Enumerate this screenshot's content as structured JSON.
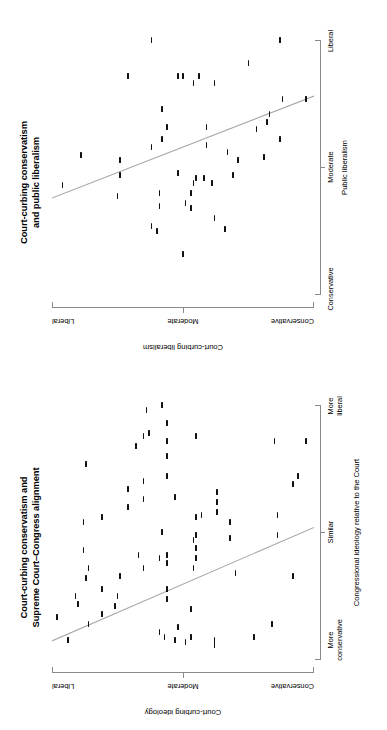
{
  "figure": {
    "orientation": "rotated-90-ccw",
    "background": "#ffffff",
    "point_color": "#111111",
    "fit_line_color": "#a8a8a8",
    "axis_color": "#8a8a8a"
  },
  "panels": [
    {
      "id": "congress",
      "title_line1": "Court-curbing conservatism and",
      "title_line2": "Supreme Court–Congress alignment",
      "x_axis_title": "Congressional ideology relative to the Court",
      "x_tick_labels": [
        "More\nconservative",
        "Similar",
        "More\nliberal"
      ],
      "x_tick_label_1": "More",
      "x_tick_label_1b": "conservative",
      "x_tick_label_2": "Similar",
      "x_tick_label_3": "More",
      "x_tick_label_3b": "liberal",
      "y_axis_title": "Court-curbing ideology",
      "y_tick_labels": [
        "Conservative",
        "Moderate",
        "Liberal"
      ]
    },
    {
      "id": "public",
      "title_line1": "Court-curbing conservatism",
      "title_line2": "and public liberalism",
      "x_axis_title": "Public liberalism",
      "x_tick_label_1": "Conservative",
      "x_tick_label_2": "Moderate",
      "x_tick_label_3": "Liberal",
      "y_axis_title": "Court-curbing liberalism",
      "y_tick_labels": [
        "Conservative",
        "Moderate",
        "Liberal"
      ]
    }
  ],
  "chart_data": [
    {
      "type": "scatter",
      "panel": "congress",
      "title": "Court-curbing conservatism and Supreme Court–Congress alignment",
      "xlabel": "Congressional ideology relative to the Court",
      "ylabel": "Court-curbing ideology",
      "xlim": [
        0,
        100
      ],
      "ylim": [
        0,
        100
      ],
      "grid": false,
      "legend": null,
      "xtick_values": [
        12,
        50,
        90
      ],
      "xtick_labels": [
        "More conservative",
        "Similar",
        "More liberal"
      ],
      "ytick_values": [
        8,
        50,
        92
      ],
      "ytick_labels": [
        "Conservative",
        "Moderate",
        "Liberal"
      ],
      "fit_line": {
        "x0": 7.5,
        "y0": 100,
        "x1": 52,
        "y1": 0
      },
      "points": [
        {
          "x": 8,
          "y": 94
        },
        {
          "x": 17,
          "y": 98
        },
        {
          "x": 22,
          "y": 90
        },
        {
          "x": 25,
          "y": 91
        },
        {
          "x": 14,
          "y": 86
        },
        {
          "x": 32,
          "y": 87
        },
        {
          "x": 36,
          "y": 86
        },
        {
          "x": 43,
          "y": 88
        },
        {
          "x": 54,
          "y": 88
        },
        {
          "x": 77,
          "y": 87
        },
        {
          "x": 18,
          "y": 81
        },
        {
          "x": 28,
          "y": 81
        },
        {
          "x": 56,
          "y": 81
        },
        {
          "x": 21,
          "y": 76
        },
        {
          "x": 25,
          "y": 75
        },
        {
          "x": 33,
          "y": 74
        },
        {
          "x": 60,
          "y": 71
        },
        {
          "x": 67,
          "y": 71
        },
        {
          "x": 84,
          "y": 68
        },
        {
          "x": 36,
          "y": 65
        },
        {
          "x": 41,
          "y": 67
        },
        {
          "x": 63,
          "y": 65
        },
        {
          "x": 70,
          "y": 65
        },
        {
          "x": 88,
          "y": 65
        },
        {
          "x": 89,
          "y": 63
        },
        {
          "x": 98,
          "y": 64
        },
        {
          "x": 11,
          "y": 59
        },
        {
          "x": 9,
          "y": 57
        },
        {
          "x": 40,
          "y": 59
        },
        {
          "x": 50,
          "y": 58
        },
        {
          "x": 24,
          "y": 56
        },
        {
          "x": 28,
          "y": 56
        },
        {
          "x": 38,
          "y": 56
        },
        {
          "x": 41,
          "y": 56
        },
        {
          "x": 72,
          "y": 56
        },
        {
          "x": 80,
          "y": 56
        },
        {
          "x": 86,
          "y": 56
        },
        {
          "x": 93,
          "y": 56
        },
        {
          "x": 100,
          "y": 58
        },
        {
          "x": 8,
          "y": 53
        },
        {
          "x": 13,
          "y": 52
        },
        {
          "x": 64,
          "y": 53
        },
        {
          "x": 7,
          "y": 49
        },
        {
          "x": 9,
          "y": 47
        },
        {
          "x": 20,
          "y": 47
        },
        {
          "x": 36,
          "y": 46
        },
        {
          "x": 40,
          "y": 45
        },
        {
          "x": 44,
          "y": 45
        },
        {
          "x": 47,
          "y": 46
        },
        {
          "x": 49,
          "y": 45
        },
        {
          "x": 56,
          "y": 45
        },
        {
          "x": 57,
          "y": 43
        },
        {
          "x": 88,
          "y": 45
        },
        {
          "x": 6,
          "y": 38
        },
        {
          "x": 8,
          "y": 38
        },
        {
          "x": 58,
          "y": 37
        },
        {
          "x": 62,
          "y": 37
        },
        {
          "x": 66,
          "y": 37
        },
        {
          "x": 48,
          "y": 32
        },
        {
          "x": 54,
          "y": 32
        },
        {
          "x": 34,
          "y": 30
        },
        {
          "x": 9,
          "y": 23
        },
        {
          "x": 14,
          "y": 16
        },
        {
          "x": 49,
          "y": 14
        },
        {
          "x": 57,
          "y": 14
        },
        {
          "x": 86,
          "y": 15
        },
        {
          "x": 33,
          "y": 8
        },
        {
          "x": 69,
          "y": 8
        },
        {
          "x": 72,
          "y": 6
        },
        {
          "x": 86,
          "y": 3
        }
      ]
    },
    {
      "type": "scatter",
      "panel": "public",
      "title": "Court-curbing conservatism and public liberalism",
      "xlabel": "Public liberalism",
      "ylabel": "Court-curbing liberalism",
      "xlim": [
        0,
        100
      ],
      "ylim": [
        0,
        100
      ],
      "grid": false,
      "legend": null,
      "xtick_values": [
        10,
        50,
        90
      ],
      "xtick_labels": [
        "Conservative",
        "Moderate",
        "Liberal"
      ],
      "ytick_values": [
        8,
        50,
        92
      ],
      "ytick_labels": [
        "Conservative",
        "Moderate",
        "Liberal"
      ],
      "fit_line": {
        "x0": 38,
        "y0": 100,
        "x1": 78,
        "y1": 0
      },
      "points": [
        {
          "x": 43,
          "y": 96
        },
        {
          "x": 55,
          "y": 89
        },
        {
          "x": 39,
          "y": 75
        },
        {
          "x": 47,
          "y": 74
        },
        {
          "x": 53,
          "y": 74
        },
        {
          "x": 86,
          "y": 71
        },
        {
          "x": 27,
          "y": 62
        },
        {
          "x": 25,
          "y": 60
        },
        {
          "x": 58,
          "y": 62
        },
        {
          "x": 35,
          "y": 59
        },
        {
          "x": 40,
          "y": 59
        },
        {
          "x": 61,
          "y": 58
        },
        {
          "x": 73,
          "y": 58
        },
        {
          "x": 66,
          "y": 56
        },
        {
          "x": 100,
          "y": 62
        },
        {
          "x": 48,
          "y": 52
        },
        {
          "x": 16,
          "y": 50
        },
        {
          "x": 36,
          "y": 49
        },
        {
          "x": 86,
          "y": 52
        },
        {
          "x": 86,
          "y": 50
        },
        {
          "x": 34,
          "y": 47
        },
        {
          "x": 40,
          "y": 47
        },
        {
          "x": 44,
          "y": 46
        },
        {
          "x": 46,
          "y": 45
        },
        {
          "x": 83,
          "y": 46
        },
        {
          "x": 86,
          "y": 44
        },
        {
          "x": 46,
          "y": 42
        },
        {
          "x": 59,
          "y": 41
        },
        {
          "x": 66,
          "y": 41
        },
        {
          "x": 30,
          "y": 38
        },
        {
          "x": 44,
          "y": 39
        },
        {
          "x": 83,
          "y": 38
        },
        {
          "x": 26,
          "y": 34
        },
        {
          "x": 56,
          "y": 33
        },
        {
          "x": 47,
          "y": 31
        },
        {
          "x": 53,
          "y": 29
        },
        {
          "x": 91,
          "y": 25
        },
        {
          "x": 65,
          "y": 22
        },
        {
          "x": 54,
          "y": 19
        },
        {
          "x": 68,
          "y": 18
        },
        {
          "x": 71,
          "y": 17
        },
        {
          "x": 100,
          "y": 13
        },
        {
          "x": 61,
          "y": 13
        },
        {
          "x": 77,
          "y": 12
        },
        {
          "x": 77,
          "y": 3
        }
      ]
    }
  ]
}
